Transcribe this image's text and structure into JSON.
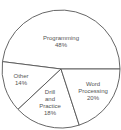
{
  "chart_data": {
    "type": "pie",
    "title": "",
    "categories": [
      "Programming",
      "Other",
      "Drill and Practice",
      "Word Processing"
    ],
    "values": [
      48,
      14,
      18,
      20
    ],
    "unit": "%",
    "labels": [
      {
        "lines": [
          "Programming",
          "48%"
        ],
        "x": 61,
        "y": 42
      },
      {
        "lines": [
          "Other",
          "14%"
        ],
        "x": 21,
        "y": 80
      },
      {
        "lines": [
          "Drill",
          "and",
          "Practice",
          "18%"
        ],
        "x": 50,
        "y": 103
      },
      {
        "lines": [
          "Word",
          "Processing",
          "20%"
        ],
        "x": 93,
        "y": 91
      }
    ],
    "colors": {
      "fill": "#ffffff",
      "stroke": "#555555"
    },
    "legend": "none",
    "start_angle_deg": 0,
    "direction": "counterclockwise"
  }
}
